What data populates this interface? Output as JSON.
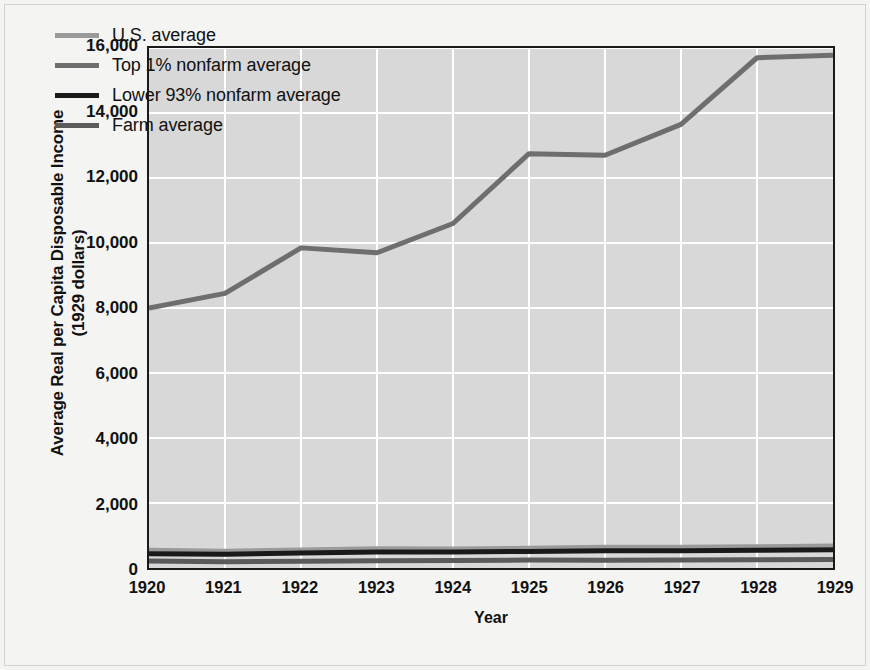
{
  "chart_data": {
    "type": "line",
    "title": "",
    "xlabel": "Year",
    "ylabel": "Average Real per Capita Disposable Income (1929 dollars)",
    "ylabel_line1": "Average Real per Capita Disposable Income",
    "ylabel_line2": "(1929 dollars)",
    "x": [
      1920,
      1921,
      1922,
      1923,
      1924,
      1925,
      1926,
      1927,
      1928,
      1929
    ],
    "xtick_labels": [
      "1920",
      "1921",
      "1922",
      "1923",
      "1924",
      "1925",
      "1926",
      "1927",
      "1928",
      "1929"
    ],
    "ytick_labels": [
      "0",
      "2,000",
      "4,000",
      "6,000",
      "8,000",
      "10,000",
      "12,000",
      "14,000",
      "16,000"
    ],
    "ytick_values": [
      0,
      2000,
      4000,
      6000,
      8000,
      10000,
      12000,
      14000,
      16000
    ],
    "xlim": [
      1920,
      1929
    ],
    "ylim": [
      0,
      16000
    ],
    "grid": true,
    "grid_color": "#ffffff",
    "plot_background": "#d8d8d8",
    "legend_position": "top-left inside",
    "series": [
      {
        "name": "U.S. average",
        "color": "#9a9a9a",
        "width": 4,
        "values": [
          560,
          530,
          570,
          610,
          600,
          620,
          650,
          650,
          670,
          690
        ]
      },
      {
        "name": "Top 1% nonfarm average",
        "color": "#6e6e6e",
        "width": 5,
        "values": [
          8000,
          8450,
          9850,
          9700,
          10600,
          12750,
          12700,
          13650,
          15700,
          15780
        ]
      },
      {
        "name": "Lower 93% nonfarm average",
        "color": "#1a1a1a",
        "width": 5,
        "values": [
          440,
          420,
          460,
          490,
          490,
          510,
          530,
          530,
          545,
          560
        ]
      },
      {
        "name": "Farm average",
        "color": "#5a5a5a",
        "width": 5,
        "values": [
          215,
          195,
          205,
          225,
          230,
          245,
          240,
          245,
          255,
          265
        ]
      }
    ]
  },
  "legend": {
    "entries": [
      {
        "label": "U.S. average",
        "color": "#9a9a9a"
      },
      {
        "label": "Top 1% nonfarm average",
        "color": "#6e6e6e"
      },
      {
        "label": "Lower 93% nonfarm average",
        "color": "#1a1a1a"
      },
      {
        "label": "Farm average",
        "color": "#5a5a5a"
      }
    ]
  }
}
